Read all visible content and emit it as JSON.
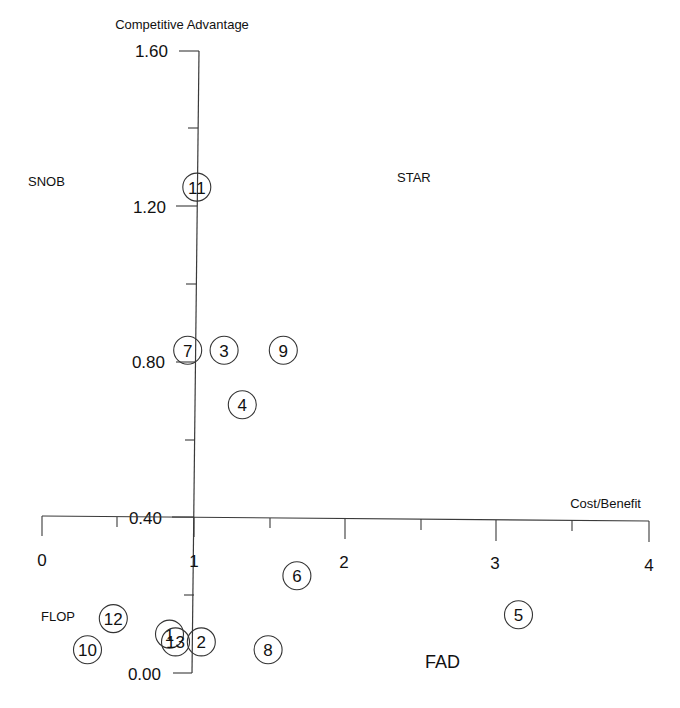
{
  "chart_data": {
    "type": "scatter",
    "title": "",
    "xlabel": "Cost/Benefit",
    "ylabel": "Competitive Advantage",
    "xlim": [
      0,
      4
    ],
    "ylim": [
      0.0,
      1.6
    ],
    "x_ticks": [
      "0",
      "1",
      "2",
      "3",
      "4"
    ],
    "y_ticks": [
      "0.00",
      "0.40",
      "0.80",
      "1.20",
      "1.60"
    ],
    "grid": false,
    "quadrant_labels": {
      "top_left": "SNOB",
      "top_right": "STAR",
      "bottom_left": "FLOP",
      "bottom_right": "FAD"
    },
    "points": [
      {
        "label": "11",
        "x": 1.02,
        "y": 1.25
      },
      {
        "label": "7",
        "x": 0.96,
        "y": 0.83
      },
      {
        "label": "3",
        "x": 1.2,
        "y": 0.83
      },
      {
        "label": "9",
        "x": 1.59,
        "y": 0.83
      },
      {
        "label": "4",
        "x": 1.32,
        "y": 0.69
      },
      {
        "label": "6",
        "x": 1.68,
        "y": 0.25
      },
      {
        "label": "5",
        "x": 3.14,
        "y": 0.15
      },
      {
        "label": "12",
        "x": 0.47,
        "y": 0.14
      },
      {
        "label": "10",
        "x": 0.3,
        "y": 0.06
      },
      {
        "label": "1",
        "x": 0.84,
        "y": 0.1
      },
      {
        "label": "13",
        "x": 0.88,
        "y": 0.08
      },
      {
        "label": "2",
        "x": 1.05,
        "y": 0.08
      },
      {
        "label": "8",
        "x": 1.49,
        "y": 0.06
      }
    ]
  }
}
